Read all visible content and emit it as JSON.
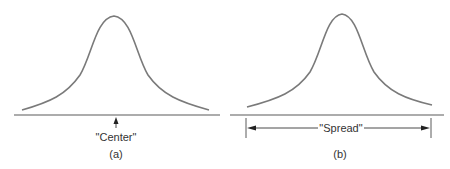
{
  "panels": [
    {
      "id": "a",
      "caption": "(a)",
      "annotation": "\"Center\"",
      "annotation_type": "point-arrow"
    },
    {
      "id": "b",
      "caption": "(b)",
      "annotation": "\"Spread\"",
      "annotation_type": "double-arrow"
    }
  ],
  "colors": {
    "curve": "#7a7a7a",
    "line": "#5a5a5a",
    "text": "#333333"
  }
}
